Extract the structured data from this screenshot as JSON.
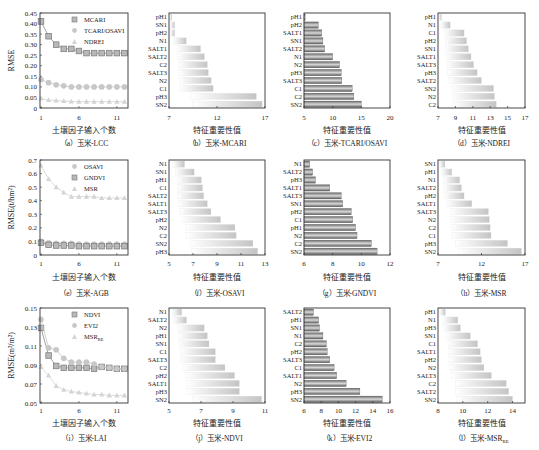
{
  "chart_data": [
    {
      "id": "a",
      "type": "line",
      "caption": "（a）玉米-LCC",
      "xlabel": "土壤因子输入个数",
      "ylabel": "RMSE",
      "x": [
        1,
        2,
        3,
        4,
        5,
        6,
        7,
        8,
        9,
        10,
        11,
        12
      ],
      "xticks": [
        1,
        6,
        11
      ],
      "ylim": [
        0,
        0.45
      ],
      "yticks": [
        0,
        0.05,
        0.1,
        0.15,
        0.2,
        0.25,
        0.3,
        0.35,
        0.4,
        0.45
      ],
      "ytick_labels": [
        "0",
        "0.05",
        "0.10",
        "0.15",
        "0.20",
        "0.25",
        "0.30",
        "0.35",
        "0.40",
        "0.45"
      ],
      "series": [
        {
          "name": "MCARI",
          "marker": "square",
          "color": "#8a8a8a",
          "values": [
            0.41,
            0.34,
            0.3,
            0.28,
            0.28,
            0.27,
            0.26,
            0.26,
            0.26,
            0.26,
            0.26,
            0.26
          ]
        },
        {
          "name": "TCARI/OSAVI",
          "marker": "circle",
          "color": "#c8c8c8",
          "values": [
            0.135,
            0.12,
            0.11,
            0.105,
            0.1,
            0.1,
            0.1,
            0.1,
            0.1,
            0.1,
            0.1,
            0.1
          ]
        },
        {
          "name": "NDREI",
          "marker": "triangle",
          "color": "#d4d4d4",
          "values": [
            0.045,
            0.038,
            0.035,
            0.033,
            0.031,
            0.03,
            0.03,
            0.03,
            0.03,
            0.03,
            0.03,
            0.03
          ]
        }
      ]
    },
    {
      "id": "b",
      "type": "bar",
      "caption": "（b）玉米-MCARI",
      "xlabel": "特征重要性值",
      "xlim": [
        7,
        17
      ],
      "xticks": [
        7,
        12,
        17
      ],
      "style": "light",
      "categories": [
        "pH1",
        "SN1",
        "pH2",
        "N1",
        "SALT1",
        "SALT2",
        "C2",
        "SALT3",
        "N2",
        "C1",
        "pH3",
        "SN2"
      ],
      "values": [
        7.3,
        7.6,
        7.6,
        8.8,
        10.3,
        10.7,
        11.0,
        11.1,
        11.4,
        11.6,
        16.1,
        16.7
      ]
    },
    {
      "id": "c",
      "type": "bar",
      "caption": "（c）玉米-TCARI/OSAVI",
      "xlabel": "特征重要性值",
      "xlim": [
        5,
        20
      ],
      "xticks": [
        5,
        10,
        15,
        20
      ],
      "style": "dark",
      "categories": [
        "pH1",
        "pH2",
        "SALT1",
        "SN1",
        "SALT2",
        "N1",
        "N2",
        "pH3",
        "SALT3",
        "C1",
        "C2",
        "SN2"
      ],
      "values": [
        5.2,
        7.5,
        8.1,
        8.3,
        8.6,
        10.0,
        11.2,
        11.5,
        11.6,
        13.4,
        13.7,
        15.0
      ]
    },
    {
      "id": "d",
      "type": "bar",
      "caption": "（d）玉米-NDREI",
      "xlabel": "特征重要性值",
      "xlim": [
        7,
        17
      ],
      "xticks": [
        7,
        9,
        11,
        13,
        15,
        17
      ],
      "style": "light",
      "categories": [
        "pH1",
        "N1",
        "C1",
        "pH2",
        "SN1",
        "SALT1",
        "SALT3",
        "pH3",
        "SALT2",
        "SN2",
        "N2",
        "C2"
      ],
      "values": [
        7.4,
        8.4,
        10.0,
        10.3,
        10.5,
        10.8,
        11.1,
        11.5,
        12.0,
        13.4,
        13.5,
        13.7
      ]
    },
    {
      "id": "e",
      "type": "line",
      "caption": "（e）玉米-AGB",
      "xlabel": "土壤因子输入个数",
      "ylabel": "RMSE(t/hm²)",
      "x": [
        1,
        2,
        3,
        4,
        5,
        6,
        7,
        8,
        9,
        10,
        11,
        12
      ],
      "xticks": [
        1,
        6,
        11
      ],
      "ylim": [
        0,
        0.7
      ],
      "yticks": [
        0,
        0.1,
        0.2,
        0.3,
        0.4,
        0.5,
        0.6,
        0.7
      ],
      "ytick_labels": [
        "0",
        "0.1",
        "0.2",
        "0.3",
        "0.4",
        "0.5",
        "0.6",
        "0.7"
      ],
      "series": [
        {
          "name": "OSAVI",
          "marker": "circle",
          "color": "#c8c8c8",
          "values": [
            0.1,
            0.09,
            0.085,
            0.085,
            0.085,
            0.08,
            0.08,
            0.08,
            0.08,
            0.08,
            0.08,
            0.08
          ]
        },
        {
          "name": "GNDVI",
          "marker": "square",
          "color": "#8a8a8a",
          "values": [
            0.09,
            0.075,
            0.07,
            0.07,
            0.07,
            0.065,
            0.065,
            0.065,
            0.065,
            0.065,
            0.065,
            0.065
          ]
        },
        {
          "name": "MSR",
          "marker": "triangle",
          "color": "#d4d4d4",
          "values": [
            0.66,
            0.56,
            0.5,
            0.46,
            0.43,
            0.43,
            0.43,
            0.43,
            0.42,
            0.42,
            0.42,
            0.42
          ]
        }
      ]
    },
    {
      "id": "f",
      "type": "bar",
      "caption": "（f）玉米-OSAVI",
      "xlabel": "特征重要性值",
      "xlim": [
        5,
        13
      ],
      "xticks": [
        5,
        7,
        9,
        11,
        13
      ],
      "style": "light",
      "categories": [
        "N1",
        "SN1",
        "pH1",
        "C1",
        "SALT2",
        "SALT1",
        "SALT3",
        "pH2",
        "N2",
        "C2",
        "SN2",
        "pH3"
      ],
      "values": [
        6.3,
        7.1,
        7.7,
        7.8,
        7.9,
        8.2,
        8.5,
        9.3,
        10.5,
        10.6,
        12.0,
        12.4
      ]
    },
    {
      "id": "g",
      "type": "bar",
      "caption": "（g）玉米-GNDVI",
      "xlabel": "特征重要性值",
      "xlim": [
        6,
        12
      ],
      "xticks": [
        6,
        8,
        10,
        12
      ],
      "style": "dark",
      "categories": [
        "N1",
        "SALT2",
        "pH3",
        "SALT1",
        "SALT3",
        "SN1",
        "pH2",
        "C1",
        "pH1",
        "N2",
        "C2",
        "SN2"
      ],
      "values": [
        6.4,
        6.6,
        6.8,
        7.8,
        8.6,
        8.7,
        9.3,
        9.4,
        9.6,
        9.7,
        10.7,
        11.1
      ]
    },
    {
      "id": "h",
      "type": "bar",
      "caption": "（h）玉米-MSR",
      "xlabel": "特征重要性值",
      "xlim": [
        7,
        17
      ],
      "xticks": [
        7,
        12,
        17
      ],
      "style": "light",
      "categories": [
        "SN1",
        "pH1",
        "N1",
        "SALT2",
        "pH2",
        "SALT1",
        "SALT3",
        "N2",
        "C2",
        "C1",
        "pH3",
        "SN2"
      ],
      "values": [
        7.8,
        8.6,
        9.5,
        9.7,
        10.0,
        10.9,
        12.8,
        12.9,
        13.0,
        13.1,
        15.0,
        16.6
      ]
    },
    {
      "id": "i",
      "type": "line",
      "caption": "（i）玉米-LAI",
      "xlabel": "土壤因子输入个数",
      "ylabel": "RMSE(m²/m²)",
      "x": [
        1,
        2,
        3,
        4,
        5,
        6,
        7,
        8,
        9,
        10,
        11,
        12
      ],
      "xticks": [
        1,
        6,
        11
      ],
      "ylim": [
        0.05,
        0.15
      ],
      "yticks": [
        0.05,
        0.07,
        0.09,
        0.11,
        0.13,
        0.15
      ],
      "ytick_labels": [
        "0.05",
        "0.07",
        "0.09",
        "0.11",
        "0.13",
        "0.15"
      ],
      "series": [
        {
          "name": "NDVI",
          "marker": "square",
          "color": "#8a8a8a",
          "values": [
            0.129,
            0.1,
            0.089,
            0.087,
            0.087,
            0.087,
            0.087,
            0.086,
            0.088,
            0.087,
            0.086,
            0.086
          ]
        },
        {
          "name": "EVI2",
          "marker": "circle",
          "color": "#c8c8c8",
          "values": [
            0.138,
            0.108,
            0.106,
            0.097,
            0.093,
            0.093,
            0.093,
            0.091,
            0.088,
            0.087,
            0.086,
            0.086
          ]
        },
        {
          "name": "MSR_RE",
          "label_main": "MSR",
          "label_sub": "RE",
          "marker": "triangle",
          "color": "#d4d4d4",
          "values": [
            0.088,
            0.079,
            0.068,
            0.064,
            0.062,
            0.061,
            0.06,
            0.059,
            0.059,
            0.058,
            0.058,
            0.058
          ]
        }
      ]
    },
    {
      "id": "j",
      "type": "bar",
      "caption": "（j）玉米-NDVI",
      "xlabel": "特征重要性值",
      "xlim": [
        5,
        11
      ],
      "xticks": [
        5,
        7,
        9,
        11
      ],
      "style": "light",
      "categories": [
        "N1",
        "SALT2",
        "N2",
        "pH1",
        "SN1",
        "C1",
        "SALT3",
        "C2",
        "pH2",
        "SALT1",
        "pH3",
        "SN2"
      ],
      "values": [
        5.8,
        6.1,
        7.2,
        7.4,
        7.5,
        7.9,
        7.9,
        8.5,
        9.1,
        9.4,
        9.4,
        10.8
      ]
    },
    {
      "id": "k",
      "type": "bar",
      "caption": "（k）玉米-EVI2",
      "xlabel": "特征重要性值",
      "xlim": [
        6,
        16
      ],
      "xticks": [
        6,
        8,
        10,
        12,
        14,
        16
      ],
      "style": "dark",
      "categories": [
        "SALT2",
        "pH1",
        "SN1",
        "N1",
        "C2",
        "pH2",
        "SALT3",
        "C1",
        "SALT1",
        "N2",
        "pH3",
        "SN2"
      ],
      "values": [
        7.1,
        7.7,
        7.8,
        8.2,
        8.6,
        8.7,
        9.0,
        9.5,
        9.8,
        10.9,
        12.5,
        15.1
      ]
    },
    {
      "id": "l",
      "type": "bar",
      "caption_main": "（l）玉米-MSR",
      "caption_sub": "RE",
      "xlabel": "特征重要性值",
      "xlim": [
        8,
        15
      ],
      "xticks": [
        8,
        10,
        12,
        14
      ],
      "style": "light",
      "categories": [
        "pH1",
        "N1",
        "pH3",
        "SN1",
        "C1",
        "SALT1",
        "pH2",
        "N2",
        "SALT3",
        "C2",
        "SALT2",
        "SN2"
      ],
      "values": [
        8.6,
        9.6,
        9.8,
        10.6,
        11.2,
        11.4,
        11.5,
        11.7,
        12.3,
        13.5,
        13.7,
        14.0
      ]
    }
  ]
}
